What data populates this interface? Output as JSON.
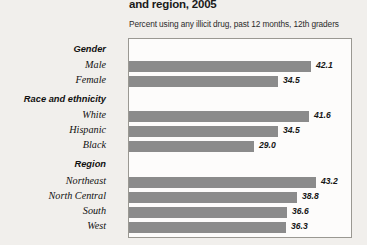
{
  "header": {
    "title": "and region, 2005",
    "subtitle": "Percent using any illicit drug, past 12 months, 12th graders"
  },
  "colors": {
    "bar": "#8b8b8b",
    "background": "#f1efec",
    "plot_background": "#fdfcfb",
    "plot_border": "#9a9892",
    "text": "#111111"
  },
  "chart_data": {
    "type": "bar",
    "orientation": "horizontal",
    "title": "and region, 2005",
    "subtitle": "Percent using any illicit drug, past 12 months, 12th graders",
    "xlabel": "",
    "ylabel": "",
    "xlim": [
      0,
      50
    ],
    "grid": false,
    "legend": false,
    "value_format": "one-decimal",
    "groups": [
      {
        "name": "Gender",
        "categories": [
          "Male",
          "Female"
        ],
        "values": [
          42.1,
          34.5
        ]
      },
      {
        "name": "Race and ethnicity",
        "categories": [
          "White",
          "Hispanic",
          "Black"
        ],
        "values": [
          41.6,
          34.5,
          29.0
        ]
      },
      {
        "name": "Region",
        "categories": [
          "Northeast",
          "North Central",
          "South",
          "West"
        ],
        "values": [
          43.2,
          38.8,
          36.6,
          36.3
        ]
      }
    ],
    "categories": [
      "Male",
      "Female",
      "White",
      "Hispanic",
      "Black",
      "Northeast",
      "North Central",
      "South",
      "West"
    ],
    "values": [
      42.1,
      34.5,
      41.6,
      34.5,
      29.0,
      43.2,
      38.8,
      36.6,
      36.3
    ]
  },
  "rows": [
    {
      "kind": "group",
      "label": "Gender",
      "value": "",
      "top": 5
    },
    {
      "kind": "bar",
      "label": "Male",
      "value": "42.1",
      "top": 20,
      "width": 182
    },
    {
      "kind": "bar",
      "label": "Female",
      "value": "34.5",
      "top": 35,
      "width": 149
    },
    {
      "kind": "group",
      "label": "Race and ethnicity",
      "value": "",
      "top": 55
    },
    {
      "kind": "bar",
      "label": "White",
      "value": "41.6",
      "top": 70,
      "width": 180
    },
    {
      "kind": "bar",
      "label": "Hispanic",
      "value": "34.5",
      "top": 85,
      "width": 149
    },
    {
      "kind": "bar",
      "label": "Black",
      "value": "29.0",
      "top": 100,
      "width": 125
    },
    {
      "kind": "group",
      "label": "Region",
      "value": "",
      "top": 120
    },
    {
      "kind": "bar",
      "label": "Northeast",
      "value": "43.2",
      "top": 136,
      "width": 187
    },
    {
      "kind": "bar",
      "label": "North Central",
      "value": "38.8",
      "top": 151,
      "width": 168
    },
    {
      "kind": "bar",
      "label": "South",
      "value": "36.6",
      "top": 166,
      "width": 158
    },
    {
      "kind": "bar",
      "label": "West",
      "value": "36.3",
      "top": 181,
      "width": 157
    }
  ]
}
